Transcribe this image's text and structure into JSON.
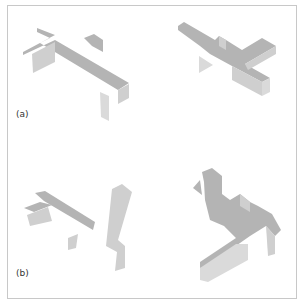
{
  "figure": {
    "frame_border_color": "#c8c8c8",
    "colors": {
      "top": "#b4b4b4",
      "side": "#cfcfcf",
      "front": "#dadada"
    },
    "labels": [
      {
        "text": "(a)",
        "x": 16,
        "y": 109
      },
      {
        "text": "(b)",
        "x": 16,
        "y": 268
      }
    ],
    "panels": [
      {
        "name": "panel-a-left",
        "polys": [
          {
            "pts": "37,28 55,35 23,52 23,55 55,40 129,83 118,90 40,43 50,38 37,32",
            "face": "top"
          },
          {
            "pts": "84,38 94,34 103,40 103,52 92,46",
            "face": "top"
          },
          {
            "pts": "32,54 55,42 55,62 33,73",
            "face": "side"
          },
          {
            "pts": "118,90 129,84 129,98 118,104",
            "face": "side"
          },
          {
            "pts": "100,92 109,96 109,121 101,117",
            "face": "front"
          }
        ]
      },
      {
        "name": "panel-a-right",
        "polys": [
          {
            "pts": "178,26 184,22 215,40 219,36 226,40 242,50 262,38 276,46 245,64 270,78 262,82 232,66 210,54 200,46 178,30",
            "face": "top"
          },
          {
            "pts": "232,66 262,82 262,96 232,80",
            "face": "side"
          },
          {
            "pts": "262,82 270,78 270,92 262,96",
            "face": "front"
          },
          {
            "pts": "245,64 276,46 276,54 248,70",
            "face": "side"
          },
          {
            "pts": "219,36 226,40 226,50 219,46",
            "face": "side"
          },
          {
            "pts": "199,56 213,65 199,73",
            "face": "front"
          }
        ]
      },
      {
        "name": "panel-b-left",
        "polys": [
          {
            "pts": "24,208 40,202 52,205 34,212",
            "face": "top"
          },
          {
            "pts": "35,193 45,191 95,222 93,230 44,201",
            "face": "top"
          },
          {
            "pts": "27,215 48,207 52,221 30,226",
            "face": "side"
          },
          {
            "pts": "68,238 78,234 76,248 68,250",
            "face": "side"
          },
          {
            "pts": "112,189 122,184 132,192 118,240 125,246 125,268 115,271 117,252 106,246",
            "face": "side"
          }
        ]
      },
      {
        "name": "panel-b-right",
        "polys": [
          {
            "pts": "202,172 212,168 222,176 222,194 230,200 240,194 250,202 258,206 272,214 281,230 275,236 266,226 250,236 230,250 210,266 200,268 200,262 236,238 224,226 210,220 205,200 204,182",
            "face": "top"
          },
          {
            "pts": "193,188 200,180 202,195",
            "face": "top"
          },
          {
            "pts": "200,268 236,244 248,244 248,260 208,282 200,280",
            "face": "front"
          },
          {
            "pts": "266,226 275,236 275,254 268,256",
            "face": "side"
          },
          {
            "pts": "240,194 250,202 250,212 240,206",
            "face": "side"
          }
        ]
      }
    ]
  }
}
